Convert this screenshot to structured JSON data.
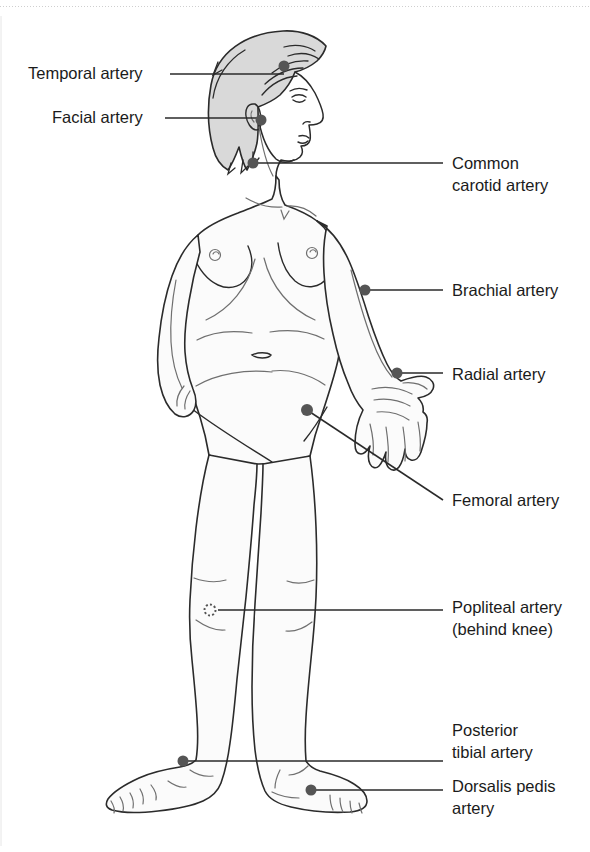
{
  "page": {
    "background_color": "#ffffff",
    "width": 590,
    "height": 852,
    "top_rule_color": "#cfcfcf",
    "edge_line_color": "#e6e6e6"
  },
  "figure": {
    "body_fill": "#fbfbfb",
    "outline_color": "#2b2b2b",
    "hair_fill": "#d9d9d9",
    "marker_color": "#555555"
  },
  "labels": [
    {
      "id": "temporal",
      "text": "Temporal artery",
      "lines": [
        "Temporal artery"
      ],
      "side": "left",
      "text_x": 28,
      "text_y": 79,
      "anchor": "start",
      "marker": {
        "x": 284,
        "y": 66,
        "r": 5.5,
        "style": "filled"
      },
      "leader": "M 170 74 L 284 74"
    },
    {
      "id": "facial",
      "text": "Facial artery",
      "lines": [
        "Facial artery"
      ],
      "side": "left",
      "text_x": 52,
      "text_y": 123,
      "anchor": "start",
      "marker": {
        "x": 261,
        "y": 120,
        "r": 5.5,
        "style": "filled"
      },
      "leader": "M 165 118 L 261 118"
    },
    {
      "id": "common-carotid",
      "text": "Common carotid artery",
      "lines": [
        "Common",
        "carotid artery"
      ],
      "side": "right",
      "text_x": 452,
      "text_y": 169,
      "anchor": "start",
      "marker": {
        "x": 253,
        "y": 163,
        "r": 5.5,
        "style": "filled"
      },
      "leader": "M 253 163 L 443 163"
    },
    {
      "id": "brachial",
      "text": "Brachial artery",
      "lines": [
        "Brachial artery"
      ],
      "side": "right",
      "text_x": 452,
      "text_y": 296,
      "anchor": "start",
      "marker": {
        "x": 365,
        "y": 290,
        "r": 5.5,
        "style": "filled"
      },
      "leader": "M 365 290 L 443 290"
    },
    {
      "id": "radial",
      "text": "Radial artery",
      "lines": [
        "Radial artery"
      ],
      "side": "right",
      "text_x": 452,
      "text_y": 380,
      "anchor": "start",
      "marker": {
        "x": 397,
        "y": 373,
        "r": 5.5,
        "style": "filled"
      },
      "leader": "M 397 373 L 443 373"
    },
    {
      "id": "femoral",
      "text": "Femoral artery",
      "lines": [
        "Femoral artery"
      ],
      "side": "right",
      "text_x": 452,
      "text_y": 506,
      "anchor": "start",
      "marker": {
        "x": 307,
        "y": 410,
        "r": 6,
        "style": "filled"
      },
      "leader": "M 307 410 L 443 500"
    },
    {
      "id": "popliteal",
      "text": "Popliteal artery (behind knee)",
      "lines": [
        "Popliteal artery",
        "(behind knee)"
      ],
      "side": "right",
      "text_x": 452,
      "text_y": 613,
      "anchor": "start",
      "marker": {
        "x": 210,
        "y": 610,
        "r": 5.5,
        "style": "dotted"
      },
      "leader": "M 218 610 L 443 610"
    },
    {
      "id": "posterior-tibial",
      "text": "Posterior tibial artery",
      "lines": [
        "Posterior",
        "tibial artery"
      ],
      "side": "right",
      "text_x": 452,
      "text_y": 736,
      "anchor": "start",
      "marker": {
        "x": 183,
        "y": 761,
        "r": 5.5,
        "style": "filled"
      },
      "leader": "M 183 761 L 443 761"
    },
    {
      "id": "dorsalis-pedis",
      "text": "Dorsalis pedis artery",
      "lines": [
        "Dorsalis pedis",
        "artery"
      ],
      "side": "right",
      "text_x": 452,
      "text_y": 792,
      "anchor": "start",
      "marker": {
        "x": 311,
        "y": 790,
        "r": 5.5,
        "style": "filled"
      },
      "leader": "M 311 790 L 443 790"
    }
  ]
}
